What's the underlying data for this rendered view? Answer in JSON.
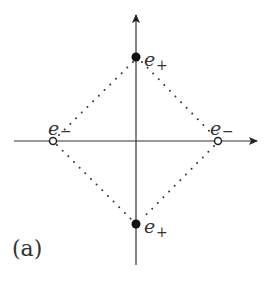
{
  "figure": {
    "panel_label": "(a)",
    "axes": {
      "origin": [
        136,
        141
      ],
      "x_start": 14,
      "x_end": 257,
      "y_start": 265,
      "y_end": 15,
      "color": "#333333"
    },
    "points": [
      {
        "id": "top",
        "x": 136,
        "y": 57,
        "style": "filled",
        "label_base": "e",
        "label_sub": "+"
      },
      {
        "id": "bottom",
        "x": 136,
        "y": 224,
        "style": "filled",
        "label_base": "e",
        "label_sub": "+"
      },
      {
        "id": "left",
        "x": 53,
        "y": 141,
        "style": "hollow",
        "label_base": "e",
        "label_sub": "−"
      },
      {
        "id": "right",
        "x": 218,
        "y": 141,
        "style": "hollow",
        "label_base": "e",
        "label_sub": "−"
      }
    ],
    "connections": "dotted diamond linking top-right-bottom-left"
  }
}
